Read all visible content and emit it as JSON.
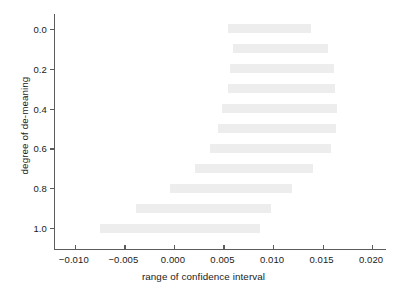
{
  "chart_data": {
    "type": "bar",
    "orientation": "horizontal",
    "title": "",
    "xlabel": "range of confidence interval",
    "ylabel": "degree of de-meaning",
    "xlim": [
      -0.012,
      0.0215
    ],
    "ylim": [
      -0.075,
      1.11
    ],
    "grid": false,
    "legend": null,
    "xticks": [
      -0.01,
      -0.005,
      0.0,
      0.005,
      0.01,
      0.015,
      0.02
    ],
    "xticklabels": [
      "−0.010",
      "−0.005",
      "0.000",
      "0.005",
      "0.010",
      "0.015",
      "0.020"
    ],
    "yticks": [
      0.0,
      0.2,
      0.4,
      0.6,
      0.8,
      1.0
    ],
    "yticklabels": [
      "0.0",
      "0.2",
      "0.4",
      "0.6",
      "0.8",
      "1.0"
    ],
    "y_axis_inverted": true,
    "bar_color": "#ededed",
    "axis_color": "#5b5b5b",
    "categories": [
      0.0,
      0.1,
      0.2,
      0.3,
      0.4,
      0.5,
      0.6,
      0.7,
      0.8,
      0.9,
      1.0
    ],
    "bars": [
      {
        "degree": 0.0,
        "low": 0.0055,
        "high": 0.0138,
        "width": 0.0083
      },
      {
        "degree": 0.1,
        "low": 0.006,
        "high": 0.0155,
        "width": 0.0095
      },
      {
        "degree": 0.2,
        "low": 0.0057,
        "high": 0.0162,
        "width": 0.0105
      },
      {
        "degree": 0.3,
        "low": 0.0055,
        "high": 0.0163,
        "width": 0.0108
      },
      {
        "degree": 0.4,
        "low": 0.0049,
        "high": 0.0165,
        "width": 0.0116
      },
      {
        "degree": 0.5,
        "low": 0.0044,
        "high": 0.0164,
        "width": 0.012
      },
      {
        "degree": 0.6,
        "low": 0.0036,
        "high": 0.0158,
        "width": 0.0122
      },
      {
        "degree": 0.7,
        "low": 0.0021,
        "high": 0.014,
        "width": 0.0119
      },
      {
        "degree": 0.8,
        "low": -0.0004,
        "high": 0.0119,
        "width": 0.0123
      },
      {
        "degree": 0.9,
        "low": -0.0038,
        "high": 0.0098,
        "width": 0.0136
      },
      {
        "degree": 1.0,
        "low": -0.0075,
        "high": 0.0087,
        "width": 0.0162
      }
    ]
  }
}
